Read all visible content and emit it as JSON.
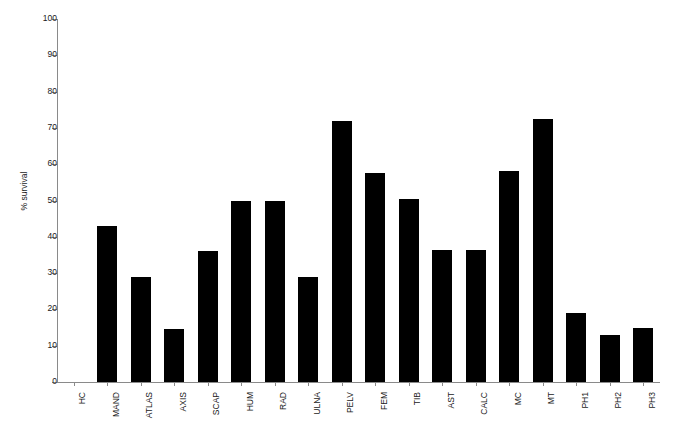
{
  "chart_data": {
    "type": "bar",
    "title": "",
    "subtitle": "",
    "xlabel": "",
    "ylabel": "% survival",
    "ylim": [
      0,
      100
    ],
    "ytick_step": 10,
    "yticks": [
      0,
      10,
      20,
      30,
      40,
      50,
      60,
      70,
      80,
      90,
      100
    ],
    "grid": false,
    "legend": false,
    "bar_color": "#000000",
    "axis_color": "#8a8a8a",
    "categories": [
      "HC",
      "MAND",
      "ATLAS",
      "AXIS",
      "SCAP",
      "HUM",
      "RAD",
      "ULNA",
      "PELV",
      "FEM",
      "TIB",
      "AST",
      "CALC",
      "MC",
      "MT",
      "PH1",
      "PH2",
      "PH3"
    ],
    "values": [
      0,
      43,
      29,
      14.5,
      36,
      50,
      50,
      29,
      72,
      57.5,
      50.5,
      36.5,
      36.5,
      58,
      72.5,
      19,
      13,
      15
    ]
  }
}
